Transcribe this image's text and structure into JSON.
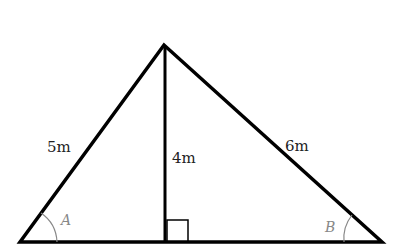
{
  "diagram": {
    "type": "triangle-with-altitude",
    "labels": {
      "left_side": "5m",
      "altitude": "4m",
      "right_side": "6m",
      "angle_left": "A",
      "angle_right": "B"
    },
    "right_angle_marker": true,
    "colors": {
      "stroke": "#000000",
      "angle_text": "#888888",
      "side_text": "#222222"
    }
  }
}
